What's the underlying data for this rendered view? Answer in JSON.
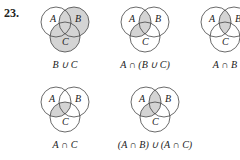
{
  "problem_number": "23.",
  "colors": {
    "shade": "#d4d4d4",
    "stroke": "#444444",
    "text": "#222222"
  },
  "set_labels": {
    "a": "A",
    "b": "B",
    "c": "C"
  },
  "diagrams": [
    {
      "id": "d1",
      "caption": "B ∪ C",
      "shaded": "b_union_c"
    },
    {
      "id": "d2",
      "caption": "A ∩ (B ∪ C)",
      "shaded": "a_inter_b_union_c"
    },
    {
      "id": "d3",
      "caption": "A ∩ B",
      "shaded": "a_inter_b"
    },
    {
      "id": "d4",
      "caption": "A ∩ C",
      "shaded": "a_inter_c"
    },
    {
      "id": "d5",
      "caption": "(A ∩ B) ∪ (A ∩ C)",
      "shaded": "a_inter_b_union_c"
    }
  ]
}
